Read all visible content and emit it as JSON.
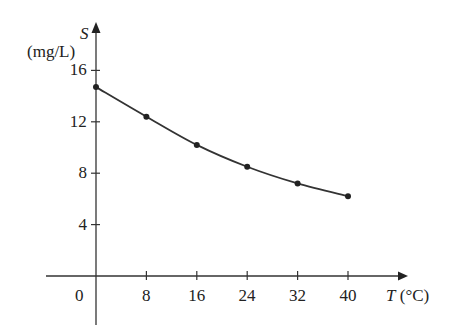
{
  "chart_data": {
    "type": "line",
    "title": "",
    "xlabel": "T (°C)",
    "ylabel": "S (mg/L)",
    "x": [
      0,
      8,
      16,
      24,
      32,
      40
    ],
    "series": [
      {
        "name": "S",
        "values": [
          14.7,
          12.4,
          10.2,
          8.5,
          7.2,
          6.2
        ]
      }
    ],
    "xticks": [
      "0",
      "8",
      "16",
      "24",
      "32",
      "40"
    ],
    "yticks": [
      "4",
      "8",
      "12",
      "16"
    ],
    "xlim": [
      -8,
      44
    ],
    "ylim": [
      -4,
      20
    ],
    "grid": false,
    "legend": "none",
    "markers": true,
    "line_color": "#333333"
  },
  "axes": {
    "y_label_var": "S",
    "y_label_unit": "(mg/L)",
    "x_label_var": "T",
    "x_label_unit": "(°C)",
    "origin_label": "0"
  }
}
